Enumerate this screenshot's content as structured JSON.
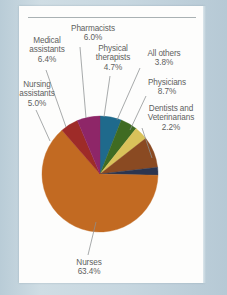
{
  "figure": {
    "background_color": "#c3d3dc",
    "card_color": "#fdfdfc",
    "text_color": "#5d5f5e",
    "rule_color": "#9aa3a6"
  },
  "chart_data": {
    "type": "pie",
    "title": "",
    "subtitle": "",
    "xlabel": "",
    "ylabel": "",
    "legend_position": "none",
    "grid": false,
    "labels_inline": true,
    "categories": [
      "Pharmacists",
      "Physical therapists",
      "All others",
      "Physicians",
      "Dentists and Veterinarians",
      "Nurses",
      "Nursing assistants",
      "Medical assistants"
    ],
    "values": [
      6.0,
      4.7,
      3.8,
      8.7,
      2.2,
      63.4,
      5.0,
      6.4
    ],
    "units": "percent",
    "colors": [
      "#1f6a8c",
      "#3f6b22",
      "#d9c25a",
      "#8a4a22",
      "#2b3550",
      "#c26a22",
      "#9e2b28",
      "#8e2668"
    ],
    "slices": [
      {
        "label": "Pharmacists",
        "percent": 6.0,
        "percent_text": "6.0%",
        "color": "#1f6a8c"
      },
      {
        "label": "Physical therapists",
        "percent": 4.7,
        "percent_text": "4.7%",
        "color": "#3f6b22"
      },
      {
        "label": "All others",
        "percent": 3.8,
        "percent_text": "3.8%",
        "color": "#d9c25a"
      },
      {
        "label": "Physicians",
        "percent": 8.7,
        "percent_text": "8.7%",
        "color": "#8a4a22"
      },
      {
        "label": "Dentists and Veterinarians",
        "percent": 2.2,
        "percent_text": "2.2%",
        "color": "#2b3550"
      },
      {
        "label": "Nurses",
        "percent": 63.4,
        "percent_text": "63.4%",
        "color": "#c26a22"
      },
      {
        "label": "Nursing assistants",
        "percent": 5.0,
        "percent_text": "5.0%",
        "color": "#9e2b28"
      },
      {
        "label": "Medical assistants",
        "percent": 6.4,
        "percent_text": "6.4%",
        "color": "#8e2668"
      }
    ]
  },
  "labels": {
    "pharmacists": {
      "name": "Pharmacists",
      "pct": "6.0%"
    },
    "medical_assistants": {
      "name_1": "Medical",
      "name_2": "assistants",
      "pct": "6.4%"
    },
    "nursing_assistants": {
      "name_1": "Nursing",
      "name_2": "assistants",
      "pct": "5.0%"
    },
    "physical_therapists": {
      "name_1": "Physical",
      "name_2": "therapists",
      "pct": "4.7%"
    },
    "all_others": {
      "name": "All others",
      "pct": "3.8%"
    },
    "physicians": {
      "name": "Physicians",
      "pct": "8.7%"
    },
    "dentists_vets": {
      "name_1": "Dentists and",
      "name_2": "Veterinarians",
      "pct": "2.2%"
    },
    "nurses": {
      "name": "Nurses",
      "pct": "63.4%"
    }
  }
}
